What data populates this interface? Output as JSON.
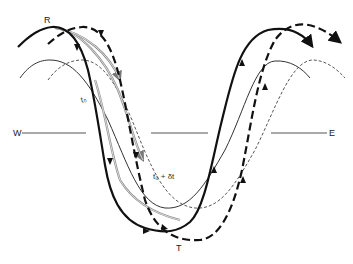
{
  "diagram": {
    "title": "",
    "labels": {
      "ridge": "R",
      "trough": "T",
      "west": "W",
      "east": "E",
      "t0": "t₀",
      "t0_plus_dt": "t₀ + δt"
    },
    "legend": {
      "thick_solid": "streamline at t0",
      "thick_dashed": "streamline at t0 + dt",
      "thin_solid": "contour at t0",
      "thin_dashed": "contour at t0 + dt",
      "gray_double": "parcel trajectories"
    },
    "colors": {
      "ink": "#111111",
      "gray_trajectory": "#8a8a8a",
      "thin_line": "#333333"
    }
  }
}
